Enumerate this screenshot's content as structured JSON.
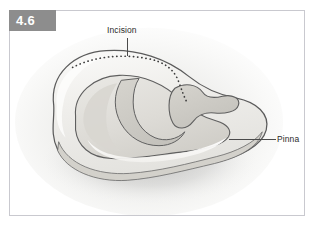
{
  "figure": {
    "number": "4.6",
    "panel": {
      "border_color": "#c9c9cf",
      "background_color": "#ffffff"
    },
    "tab": {
      "background_color": "#8d8d8d",
      "text_color": "#ffffff"
    }
  },
  "illustration": {
    "subject": "ear-pinna-anatomy",
    "alt": "Line drawing of an animal ear (pinna) seen from above with a dotted surgical incision line across the upper margin",
    "line_color": "#555555",
    "fill_light": "#f2f2f0",
    "fill_mid": "#dedcd8",
    "fill_shadow": "#c9c7c2",
    "incision_line_style": "dotted"
  },
  "callouts": [
    {
      "id": "incision",
      "label": "Incision",
      "leader_orientation": "vertical",
      "points_to": "dotted-incision-line"
    },
    {
      "id": "pinna",
      "label": "Pinna",
      "leader_orientation": "horizontal",
      "points_to": "outer-ear-flap"
    }
  ]
}
